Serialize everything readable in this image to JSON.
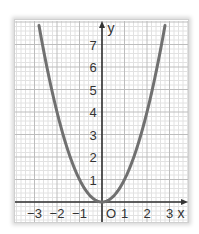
{
  "chart_data": {
    "type": "line",
    "title": "",
    "function": "y = x^2",
    "xlabel": "x",
    "ylabel": "y",
    "origin_label": "O",
    "xlim": [
      -3.9,
      3.8
    ],
    "ylim": [
      -0.9,
      7.9
    ],
    "x_ticks": [
      -3,
      -2,
      -1,
      1,
      2,
      3
    ],
    "x_tick_labels": [
      "−3",
      "−2",
      "−1",
      "1",
      "2",
      "3"
    ],
    "y_ticks": [
      1,
      2,
      3,
      4,
      5,
      6,
      7
    ],
    "y_tick_labels": [
      "1",
      "2",
      "3",
      "4",
      "5",
      "6",
      "7"
    ],
    "grid": true,
    "minor_grid_per_unit": 5,
    "series": [
      {
        "name": "y = x^2",
        "x": [
          -2.8,
          -2.5,
          -2,
          -1.5,
          -1,
          -0.5,
          0,
          0.5,
          1,
          1.5,
          2,
          2.5,
          2.8
        ],
        "values": [
          7.84,
          6.25,
          4,
          2.25,
          1,
          0.25,
          0,
          0.25,
          1,
          2.25,
          4,
          6.25,
          7.84
        ],
        "color": "#707070"
      }
    ]
  },
  "colors": {
    "curve": "#707070",
    "axis": "#333333",
    "grid_major": "#bdbdbd",
    "grid_minor": "#e2e2e2"
  }
}
